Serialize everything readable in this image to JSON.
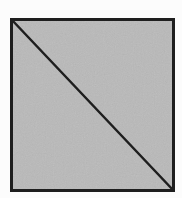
{
  "diagram": {
    "shape": "square",
    "divided_by": "diagonal",
    "diagonal_direction": "top-left to bottom-right",
    "fill_color": "#b9b9b9",
    "stroke_color": "#1e1e1e",
    "background_color": "#fcfcfc",
    "square": {
      "x": 11.5,
      "y": 19.5,
      "width": 162,
      "height": 171,
      "stroke_width": 3
    },
    "diagonal": {
      "x1": 11.5,
      "y1": 19.5,
      "x2": 173.5,
      "y2": 190.5,
      "stroke_width": 2.5
    }
  }
}
